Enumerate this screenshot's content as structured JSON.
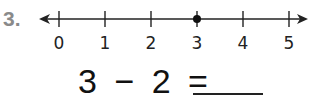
{
  "problem": {
    "number": "3.",
    "number_line": {
      "min": 0,
      "max": 5,
      "ticks": [
        "0",
        "1",
        "2",
        "3",
        "4",
        "5"
      ],
      "marked_point": 3
    },
    "equation": {
      "left": "3",
      "operator": "−",
      "right": "2",
      "equals": "=",
      "answer": ""
    }
  }
}
